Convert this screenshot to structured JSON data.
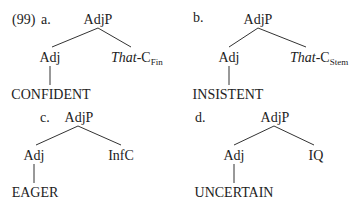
{
  "example_number": "(99)",
  "trees": [
    {
      "letter": "a.",
      "root": "AdjP",
      "left_child": "Adj",
      "right_child": {
        "italic": "That",
        "rest": "-C",
        "subscript": "Fin"
      },
      "leaf": "CONFIDENT"
    },
    {
      "letter": "b.",
      "root": "AdjP",
      "left_child": "Adj",
      "right_child": {
        "italic": "That",
        "rest": "-C",
        "subscript": "Stem"
      },
      "leaf": "INSISTENT"
    },
    {
      "letter": "c.",
      "root": "AdjP",
      "left_child": "Adj",
      "right_child": {
        "text": "InfC"
      },
      "leaf": "EAGER"
    },
    {
      "letter": "d.",
      "root": "AdjP",
      "left_child": "Adj",
      "right_child": {
        "text": "IQ"
      },
      "leaf": "UNCERTAIN"
    }
  ]
}
